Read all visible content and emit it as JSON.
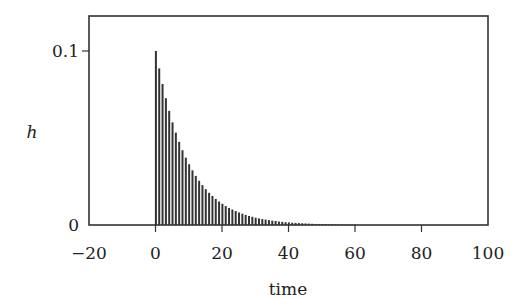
{
  "chart_data": {
    "type": "bar",
    "title": "",
    "xlabel": "time",
    "ylabel": "h",
    "xlim": [
      -20,
      100
    ],
    "ylim": [
      0,
      0.1
    ],
    "x_ticks": [
      -20,
      0,
      20,
      40,
      60,
      80,
      100
    ],
    "x_tick_labels": [
      "−20",
      "0",
      "20",
      "40",
      "60",
      "80",
      "100"
    ],
    "y_ticks": [
      0,
      0.1
    ],
    "y_tick_labels": [
      "0",
      "0.1"
    ],
    "grid": false,
    "legend": null,
    "decay_ratio": 0.9,
    "x": [
      0,
      1,
      2,
      3,
      4,
      5,
      6,
      7,
      8,
      9,
      10,
      11,
      12,
      13,
      14,
      15,
      16,
      17,
      18,
      19,
      20,
      21,
      22,
      23,
      24,
      25,
      26,
      27,
      28,
      29,
      30,
      31,
      32,
      33,
      34,
      35,
      36,
      37,
      38,
      39,
      40,
      41,
      42,
      43,
      44,
      45,
      46,
      47,
      48,
      49,
      50,
      51,
      52,
      53,
      54,
      55,
      56,
      57,
      58,
      59,
      60
    ],
    "values": [
      0.1,
      0.09,
      0.081,
      0.0729,
      0.0656,
      0.059,
      0.0531,
      0.0478,
      0.043,
      0.0387,
      0.0349,
      0.0314,
      0.0282,
      0.0254,
      0.0229,
      0.0206,
      0.0185,
      0.0167,
      0.015,
      0.0135,
      0.0122,
      0.0109,
      0.0098,
      0.0089,
      0.008,
      0.0072,
      0.0065,
      0.0058,
      0.0052,
      0.0047,
      0.0042,
      0.0038,
      0.0034,
      0.0031,
      0.0028,
      0.0025,
      0.0023,
      0.002,
      0.0018,
      0.0016,
      0.0015,
      0.0013,
      0.0012,
      0.0011,
      0.001,
      0.0009,
      0.0008,
      0.0007,
      0.0006,
      0.0006,
      0.0005,
      0.0005,
      0.0004,
      0.0004,
      0.0003,
      0.0003,
      0.0003,
      0.0002,
      0.0002,
      0.0002,
      0.0002
    ]
  },
  "axes": {
    "xlabel": "time",
    "ylabel": "h",
    "x_tick_labels": [
      "−20",
      "0",
      "20",
      "40",
      "60",
      "80",
      "100"
    ],
    "y_tick_labels": [
      "0",
      "0.1"
    ]
  }
}
